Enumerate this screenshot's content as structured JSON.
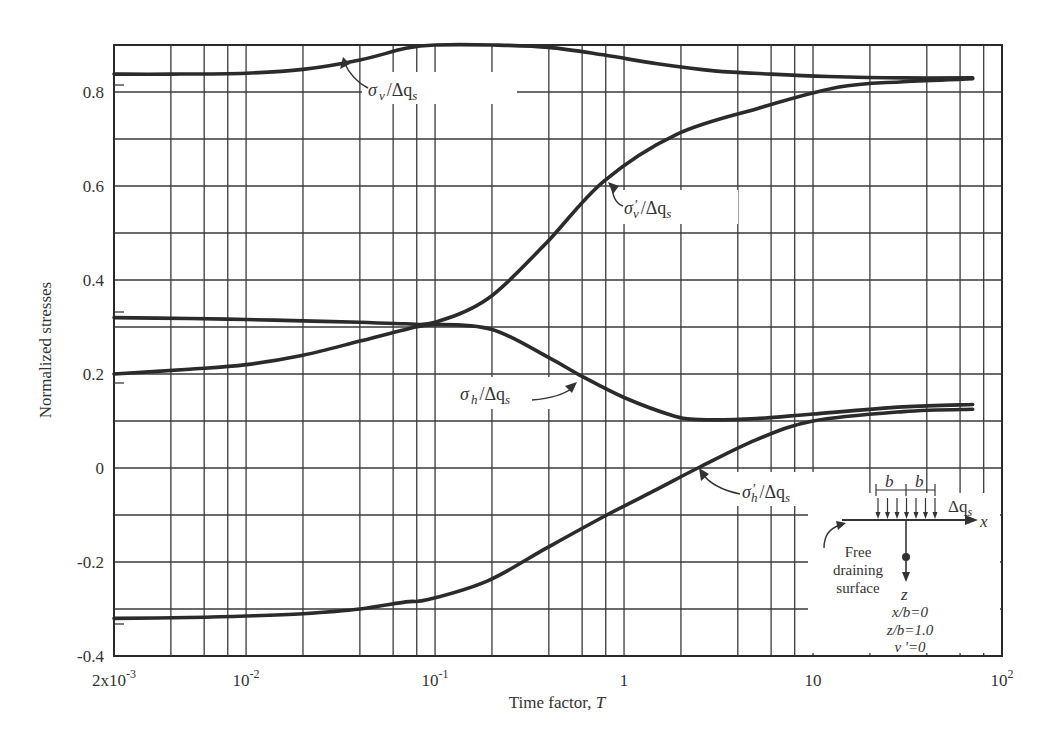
{
  "chart_data": {
    "type": "line",
    "title": "",
    "xlabel": "Time factor, T",
    "ylabel": "Normalized stresses",
    "xscale": "log",
    "xlim": [
      0.002,
      100
    ],
    "ylim": [
      -0.4,
      0.9
    ],
    "grid": true,
    "x_tick_labels": [
      "2x10^-3",
      "10^-2",
      "10^-1",
      "1",
      "10",
      "10^2"
    ],
    "x_ticks": [
      0.002,
      0.01,
      0.1,
      1,
      10,
      100
    ],
    "y_tick_labels": [
      "0.8",
      "0.6",
      "0.4",
      "0.2",
      "0",
      "-0.2",
      "-0.4"
    ],
    "y_ticks": [
      0.8,
      0.6,
      0.4,
      0.2,
      0,
      -0.2,
      -0.4
    ],
    "x_gridlines": [
      0.004,
      0.006,
      0.008,
      0.01,
      0.02,
      0.04,
      0.06,
      0.08,
      0.1,
      0.2,
      0.4,
      0.6,
      0.8,
      1,
      2,
      4,
      6,
      8,
      10,
      20,
      40,
      60,
      80
    ],
    "y_gridlines": [
      -0.3,
      -0.2,
      -0.1,
      0,
      0.1,
      0.2,
      0.3,
      0.4,
      0.5,
      0.6,
      0.7,
      0.8
    ],
    "series": [
      {
        "name": "σv/Δqs",
        "x": [
          0.002,
          0.004,
          0.01,
          0.02,
          0.04,
          0.07,
          0.1,
          0.2,
          0.4,
          0.8,
          1.5,
          3,
          6,
          12,
          30,
          70
        ],
        "y": [
          0.838,
          0.838,
          0.84,
          0.848,
          0.868,
          0.893,
          0.9,
          0.9,
          0.895,
          0.878,
          0.86,
          0.845,
          0.838,
          0.833,
          0.83,
          0.83
        ]
      },
      {
        "name": "σ'v/Δqs",
        "x": [
          0.002,
          0.005,
          0.01,
          0.02,
          0.04,
          0.07,
          0.1,
          0.19,
          0.38,
          0.78,
          1.9,
          5.1,
          13.5,
          30,
          70
        ],
        "y": [
          0.32,
          0.318,
          0.316,
          0.313,
          0.31,
          0.307,
          0.31,
          0.36,
          0.475,
          0.61,
          0.71,
          0.765,
          0.81,
          0.822,
          0.828
        ]
      },
      {
        "name": "σh/Δqs",
        "x": [
          0.002,
          0.005,
          0.01,
          0.02,
          0.04,
          0.07,
          0.1,
          0.2,
          0.4,
          0.6,
          1.0,
          1.8,
          2.5,
          5,
          10,
          30,
          70
        ],
        "y": [
          0.2,
          0.21,
          0.22,
          0.24,
          0.27,
          0.295,
          0.305,
          0.295,
          0.235,
          0.195,
          0.15,
          0.112,
          0.103,
          0.105,
          0.115,
          0.13,
          0.135
        ]
      },
      {
        "name": "σ'h/Δqs",
        "x": [
          0.002,
          0.005,
          0.01,
          0.02,
          0.04,
          0.07,
          0.092,
          0.19,
          0.39,
          0.81,
          1.5,
          2.46,
          5,
          10,
          30,
          70
        ],
        "y": [
          -0.32,
          -0.318,
          -0.315,
          -0.31,
          -0.3,
          -0.285,
          -0.28,
          -0.24,
          -0.17,
          -0.1,
          -0.045,
          0.0,
          0.06,
          0.1,
          0.12,
          0.125
        ]
      }
    ],
    "annotations": [
      {
        "label": "σv/Δqs",
        "main": "σ",
        "sub": "v",
        "rest": "/Δq",
        "rest_sub": "s"
      },
      {
        "label": "σ'v/Δqs",
        "main": "σ",
        "prime": "'",
        "sub": "v",
        "rest": "/Δq",
        "rest_sub": "s"
      },
      {
        "label": "σh/Δqs",
        "main": "σ",
        "sub": "h",
        "rest": "/Δq",
        "rest_sub": "s"
      },
      {
        "label": "σ'h/Δqs",
        "main": "σ",
        "prime": "'",
        "sub": "h",
        "rest": "/Δq",
        "rest_sub": "s"
      }
    ],
    "inset": {
      "b_left": "b",
      "b_right": "b",
      "load_label": "Δq",
      "load_sub": "s",
      "x_axis": "x",
      "z_axis": "z",
      "free_surface_line1": "Free",
      "free_surface_line2": "draining",
      "free_surface_line3": "surface",
      "params": [
        "x/b=0",
        "z/b=1.0",
        "ν '=0"
      ]
    }
  }
}
